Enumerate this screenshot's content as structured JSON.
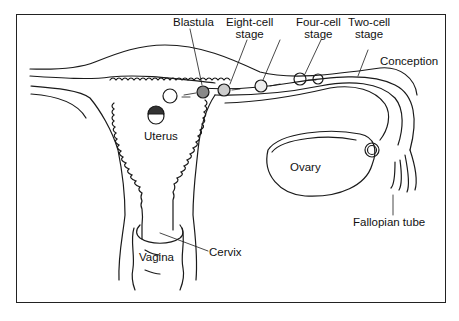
{
  "labels": {
    "blastula": "Blastula",
    "eight_cell_1": "Eight-cell",
    "eight_cell_2": "stage",
    "four_cell_1": "Four-cell",
    "four_cell_2": "stage",
    "two_cell_1": "Two-cell",
    "two_cell_2": "stage",
    "conception": "Conception",
    "uterus": "Uterus",
    "ovary": "Ovary",
    "fallopian_tube": "Fallopian tube",
    "cervix": "Cervix",
    "vagina": "Vagina"
  },
  "colors": {
    "line": "#1a1a1a",
    "background": "#ffffff"
  }
}
